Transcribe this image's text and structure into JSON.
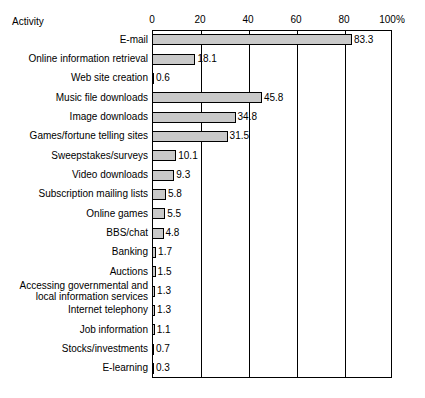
{
  "chart_data": {
    "type": "bar",
    "orientation": "horizontal",
    "title": "",
    "xlabel": "",
    "ylabel": "Activity",
    "axis_title": "Activity",
    "xlim": [
      0,
      100
    ],
    "xticks": [
      0,
      20,
      40,
      60,
      80,
      100
    ],
    "xtick_labels": [
      "0",
      "20",
      "40",
      "60",
      "80",
      "100%"
    ],
    "grid": true,
    "legend": "none",
    "categories": [
      "E-mail",
      "Online information retrieval",
      "Web site creation",
      "Music file downloads",
      "Image downloads",
      "Games/fortune telling sites",
      "Sweepstakes/surveys",
      "Video downloads",
      "Subscription mailing lists",
      "Online games",
      "BBS/chat",
      "Banking",
      "Auctions",
      "Accessing governmental and\nlocal information services",
      "Internet telephony",
      "Job information",
      "Stocks/investments",
      "E-learning"
    ],
    "values": [
      83.3,
      18.1,
      0.6,
      45.8,
      34.8,
      31.5,
      10.1,
      9.3,
      5.8,
      5.5,
      4.8,
      1.7,
      1.5,
      1.3,
      1.3,
      1.1,
      0.7,
      0.3
    ],
    "value_labels": [
      "83.3",
      "18.1",
      "0.6",
      "45.8",
      "34.8",
      "31.5",
      "10.1",
      "9.3",
      "5.8",
      "5.5",
      "4.8",
      "1.7",
      "1.5",
      "1.3",
      "1.3",
      "1.1",
      "0.7",
      "0.3"
    ],
    "bar_fill": "#c9c9c9",
    "bar_stroke": "#000000"
  }
}
